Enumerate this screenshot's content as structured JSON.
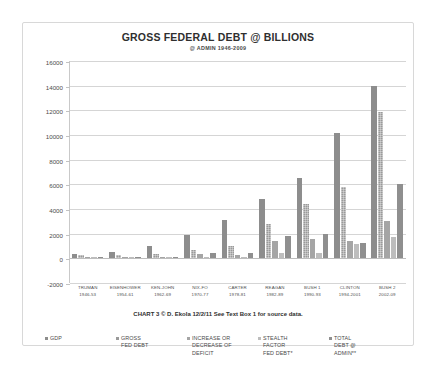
{
  "chart_data": {
    "type": "bar",
    "title": "GROSS FEDERAL DEBT @ BILLIONS",
    "subtitle": "@ ADMIN 1946-2009",
    "xlabel": "",
    "ylabel": "",
    "ylim": [
      -2000,
      16000
    ],
    "ytick_step": 2000,
    "yticks": [
      16000,
      14000,
      12000,
      10000,
      8000,
      6000,
      4000,
      2000,
      0,
      -2000
    ],
    "grid": true,
    "legend_position": "bottom",
    "categories": [
      "TRUMAN 1946-53",
      "EISENHOWER 1954-61",
      "KEN-JOHN 1962-69",
      "NIX-FO 1970-77",
      "CARTER 1978-81",
      "REAGAN 1982-89",
      "BUSH 1 1990-93",
      "CLINTON 1994-2001",
      "BUSH 2 2002-09"
    ],
    "category_lines": [
      [
        "TRUMAN",
        "1946-53"
      ],
      [
        "EISENHOWER",
        "1954-61"
      ],
      [
        "KEN-JOHN",
        "1962-69"
      ],
      [
        "NIX-FO",
        "1970-77"
      ],
      [
        "CARTER",
        "1978-81"
      ],
      [
        "REAGAN",
        "1982-89"
      ],
      [
        "BUSH 1",
        "1990-93"
      ],
      [
        "CLINTON",
        "1994-2001"
      ],
      [
        "BUSH 2",
        "2002-09"
      ]
    ],
    "series": [
      {
        "name": "GDP",
        "values": [
          390,
          530,
          980,
          1900,
          3100,
          4800,
          6500,
          10200,
          14000
        ]
      },
      {
        "name": "GROSS FED DEBT",
        "values": [
          270,
          290,
          370,
          700,
          1000,
          2800,
          4400,
          5800,
          11900
        ]
      },
      {
        "name": "INCREASE OR DECREASE OF DEFICIT",
        "values": [
          20,
          40,
          60,
          330,
          300,
          1400,
          1550,
          1400,
          3000
        ]
      },
      {
        "name": "STEALTH FACTOR FED DEBT*",
        "values": [
          10,
          20,
          40,
          120,
          150,
          450,
          400,
          1150,
          1700
        ]
      },
      {
        "name": "TOTAL DEBT @ ADMIN**",
        "values": [
          30,
          60,
          100,
          450,
          450,
          1850,
          1950,
          1250,
          6000
        ]
      }
    ],
    "series_labels_wrapped": [
      [
        "GDP"
      ],
      [
        "GROSS",
        "FED DEBT"
      ],
      [
        "INCREASE OR",
        "DECREASE OF",
        "DEFICIT"
      ],
      [
        "STEALTH",
        "FACTOR",
        "FED DEBT*"
      ],
      [
        "TOTAL",
        "DEBT @",
        "ADMIN**"
      ]
    ],
    "source_note": "CHART 3 © D. Ekola 12/2/11  See Text Box 1 for source data.",
    "colors": {
      "gdp": "#8d8d8d",
      "gross_fed_debt": "#9a9a9a",
      "deficit_change": "#a5a5a5",
      "stealth_factor": "#bdbdbd",
      "total_debt": "#8f8f8f",
      "grid": "#d5d5d5",
      "frame": "#d8d8d8"
    }
  }
}
